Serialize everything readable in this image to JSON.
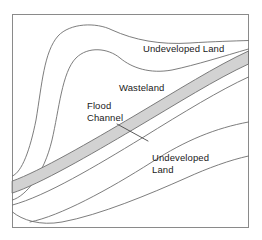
{
  "diagram": {
    "type": "schematic-map",
    "frame": {
      "stroke_color": "#8a8a8a",
      "fill_color": "#ffffff",
      "x": 12,
      "y": 14,
      "width": 237,
      "height": 214
    },
    "style": {
      "contour_stroke": "#6e6e6e",
      "band_fill": "#d2d2d2",
      "band_stroke": "#6e6e6e",
      "leader_stroke": "#4a4a4a",
      "text_color": "#1a1a1a"
    },
    "labels": [
      {
        "id": "undeveloped-top",
        "text": "Undeveloped Land",
        "x": 143,
        "y": 43
      },
      {
        "id": "wasteland",
        "text": "Wasteland",
        "x": 119,
        "y": 82
      },
      {
        "id": "flood-channel",
        "text": "Flood\nChannel",
        "x": 87,
        "y": 100,
        "has_leader_line": true
      },
      {
        "id": "undeveloped-bottom",
        "text": "Undeveloped\nLand",
        "x": 152,
        "y": 152
      }
    ],
    "regions": [
      {
        "id": "flood-channel-band",
        "name": "Flood Channel",
        "fill": "#d2d2d2"
      },
      {
        "id": "wasteland-area",
        "name": "Wasteland",
        "fill": "#ffffff"
      },
      {
        "id": "undeveloped-land-upper",
        "name": "Undeveloped Land",
        "fill": "#ffffff"
      },
      {
        "id": "undeveloped-land-lower",
        "name": "Undeveloped Land",
        "fill": "#ffffff"
      }
    ]
  }
}
